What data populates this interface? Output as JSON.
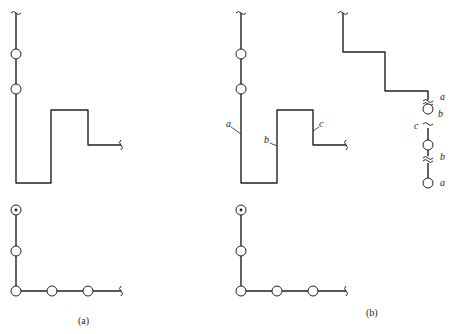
{
  "figure": {
    "panels": [
      {
        "id": "a",
        "caption": "(a)",
        "views": [
          "elevation",
          "plan"
        ]
      },
      {
        "id": "b",
        "caption": "(b)",
        "views": [
          "elevation",
          "plan",
          "side-elevation"
        ],
        "segment_labels": {
          "elevation": [
            "a",
            "b",
            "c"
          ],
          "side_elevation": [
            "a",
            "b",
            "c",
            "b",
            "a"
          ]
        }
      }
    ]
  },
  "labels": {
    "a_caption": "(a)",
    "b_caption": "(b)",
    "b_elev_a": "a",
    "b_elev_b": "b",
    "b_elev_c": "c",
    "b_side_a_top": "a",
    "b_side_b_top": "b",
    "b_side_c": "c",
    "b_side_b_bottom": "b",
    "b_side_a_bottom": "a"
  }
}
